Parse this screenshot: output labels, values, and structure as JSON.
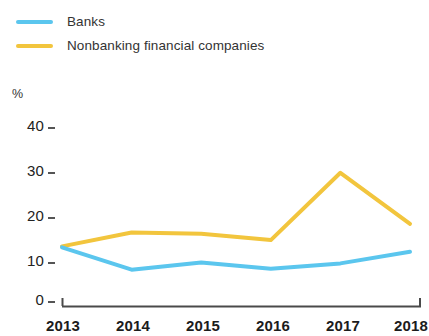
{
  "legend": {
    "position": "top-left",
    "items": [
      {
        "label": "Banks",
        "color": "#5bc6ee",
        "swatch_name": "legend-swatch-banks"
      },
      {
        "label": "Nonbanking financial companies",
        "color": "#f2c53d",
        "swatch_name": "legend-swatch-nbfc"
      }
    ]
  },
  "axes": {
    "y_unit_label": "%",
    "y_ticks": [
      "40",
      "30",
      "20",
      "10",
      "0"
    ],
    "x_ticks": [
      "2013",
      "2014",
      "2015",
      "2016",
      "2017",
      "2018"
    ]
  },
  "chart_data": {
    "type": "line",
    "title": "",
    "subtitle": "",
    "xlabel": "",
    "ylabel": "%",
    "x": [
      "2013",
      "2014",
      "2015",
      "2016",
      "2017",
      "2018"
    ],
    "categories": [
      "2013",
      "2014",
      "2015",
      "2016",
      "2017",
      "2018"
    ],
    "series": [
      {
        "name": "Banks",
        "color": "#5bc6ee",
        "values": [
          13.2,
          8.2,
          9.8,
          8.4,
          9.6,
          12.2
        ]
      },
      {
        "name": "Nonbanking financial companies",
        "color": "#f2c53d",
        "values": [
          13.4,
          16.5,
          16.2,
          14.8,
          29.8,
          18.4
        ]
      }
    ],
    "ylim": [
      0,
      43
    ],
    "xlim": [
      "2013",
      "2018"
    ],
    "y_ticks": [
      0,
      10,
      20,
      30,
      40
    ],
    "grid": false,
    "legend_position": "top-left",
    "annotations": []
  }
}
